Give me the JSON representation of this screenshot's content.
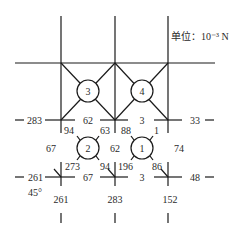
{
  "unit_label": "单位：10⁻³ N",
  "nodes": {
    "n1": "1",
    "n2": "2",
    "n3": "3",
    "n4": "4"
  },
  "left_labels": {
    "row1": "283",
    "row2": "261",
    "angle": "45°"
  },
  "right_labels": {
    "row1": "33",
    "row2": "48"
  },
  "top_row_members": {
    "left": "62",
    "right": "3"
  },
  "bottom_row_members": {
    "left": "67",
    "right": "3"
  },
  "vertical_members": {
    "left": "67",
    "middle": "62",
    "right": "74"
  },
  "diagonals": {
    "n2_top_left": "94",
    "n2_top_right": "63",
    "n2_bottom_left": "273",
    "n2_bottom_right": "94",
    "n1_top_left": "88",
    "n1_top_right": "1",
    "n1_bottom_left": "196",
    "n1_bottom_right": "86"
  },
  "bottom_labels": {
    "left": "261",
    "middle": "283",
    "right": "152"
  }
}
